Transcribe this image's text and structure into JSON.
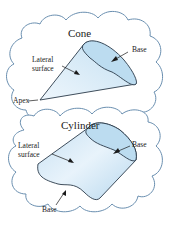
{
  "colors": {
    "fill_light": "#dcedf8",
    "fill_mid": "#bcdcf0",
    "outline": "#2a3a4a",
    "cloud_outline": "#6a8fb0"
  },
  "cone": {
    "title": "Cone",
    "labels": {
      "lateral_line1": "Lateral",
      "lateral_line2": "surface",
      "base": "Base",
      "apex": "Apex"
    }
  },
  "cylinder": {
    "title": "Cylinder",
    "labels": {
      "lateral_line1": "Lateral",
      "lateral_line2": "surface",
      "base_top": "Base",
      "base_bottom": "Base"
    }
  }
}
